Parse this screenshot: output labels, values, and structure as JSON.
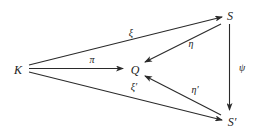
{
  "diagram": {
    "type": "commutative-diagram",
    "nodes": [
      {
        "id": "K",
        "label": "K",
        "x": 18,
        "y": 70
      },
      {
        "id": "Q",
        "label": "Q",
        "x": 135,
        "y": 70
      },
      {
        "id": "S",
        "label": "S",
        "x": 230,
        "y": 16
      },
      {
        "id": "S_prime",
        "label": "S′",
        "x": 231,
        "y": 122
      }
    ],
    "edges": [
      {
        "from": "K",
        "to": "S",
        "label": "ξ",
        "label_x": 131,
        "label_y": 33
      },
      {
        "from": "K",
        "to": "Q",
        "label": "π",
        "label_x": 92,
        "label_y": 60
      },
      {
        "from": "K",
        "to": "S_prime",
        "label": "ξ′",
        "label_x": 134,
        "label_y": 87
      },
      {
        "from": "S",
        "to": "Q",
        "label": "η",
        "label_x": 191,
        "label_y": 44
      },
      {
        "from": "S_prime",
        "to": "Q",
        "label": "η′",
        "label_x": 195,
        "label_y": 90
      },
      {
        "from": "S",
        "to": "S_prime",
        "label": "ψ",
        "label_x": 242,
        "label_y": 68
      }
    ],
    "colors": {
      "stroke": "#2a2a2a",
      "text": "#1a1a1a",
      "background": "#ffffff"
    }
  },
  "nodes": {
    "K": "K",
    "Q": "Q",
    "S": "S",
    "S_prime": "S′"
  },
  "labels": {
    "xi": "ξ",
    "pi": "π",
    "xi_prime": "ξ′",
    "eta": "η",
    "eta_prime": "η′",
    "psi": "ψ"
  }
}
